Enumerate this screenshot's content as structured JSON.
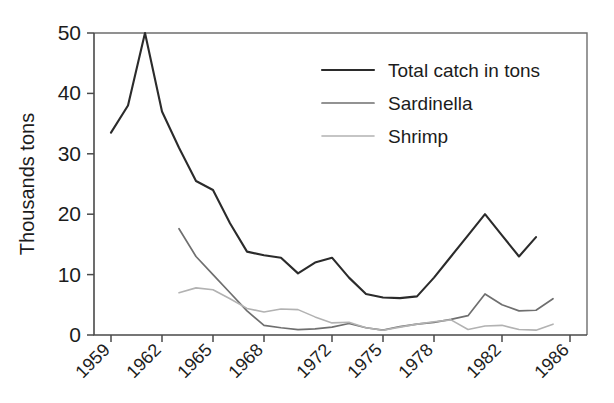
{
  "figure": {
    "background_color": "#ffffff",
    "axis_color": "#4a4a4a"
  },
  "axis": {
    "ylabel": "Thousands tons",
    "xlabel": "",
    "ytick_labels": [
      "0",
      "10",
      "20",
      "30",
      "40",
      "50"
    ],
    "xtick_labels": [
      "1959",
      "1962",
      "1965",
      "1968",
      "1972",
      "1975",
      "1978",
      "1982",
      "1986"
    ]
  },
  "legend": {
    "entries": [
      {
        "label": "Total catch in tons",
        "color": "#2b2b2b",
        "width": 2.1
      },
      {
        "label": "Sardinella",
        "color": "#6f6f6f",
        "width": 1.7
      },
      {
        "label": "Shrimp",
        "color": "#b2b2b2",
        "width": 1.6
      }
    ]
  },
  "chart_data": {
    "type": "line",
    "title": "",
    "xlabel": "",
    "ylabel": "Thousands tons",
    "xlim": [
      1958,
      1987
    ],
    "ylim": [
      0,
      50
    ],
    "yticks": [
      0,
      10,
      20,
      30,
      40,
      50
    ],
    "xticks": [
      1959,
      1962,
      1965,
      1968,
      1972,
      1975,
      1978,
      1982,
      1986
    ],
    "grid": false,
    "legend_position": "upper right",
    "x": [
      1959,
      1960,
      1961,
      1962,
      1963,
      1964,
      1965,
      1966,
      1967,
      1968,
      1969,
      1970,
      1971,
      1972,
      1973,
      1974,
      1975,
      1976,
      1977,
      1978,
      1979,
      1980,
      1981,
      1982,
      1983,
      1984,
      1985
    ],
    "series": [
      {
        "name": "Total catch in tons",
        "color": "#2b2b2b",
        "x": [
          1959,
          1960,
          1961,
          1962,
          1963,
          1964,
          1965,
          1966,
          1967,
          1968,
          1969,
          1970,
          1971,
          1972,
          1973,
          1974,
          1975,
          1976,
          1977,
          1978,
          1979,
          1980,
          1981,
          1982,
          1983,
          1984
        ],
        "values": [
          33.5,
          38.0,
          50.0,
          37.0,
          31.0,
          25.5,
          24.0,
          18.5,
          13.8,
          13.2,
          12.8,
          10.2,
          12.0,
          12.8,
          9.5,
          6.8,
          6.2,
          6.1,
          6.4,
          9.5,
          13.0,
          16.5,
          20.0,
          16.5,
          13.0,
          16.2
        ]
      },
      {
        "name": "Sardinella",
        "color": "#6f6f6f",
        "x": [
          1963,
          1964,
          1965,
          1966,
          1967,
          1968,
          1969,
          1970,
          1971,
          1972,
          1973,
          1974,
          1975,
          1976,
          1977,
          1978,
          1979,
          1980,
          1981,
          1982,
          1983,
          1984,
          1985
        ],
        "values": [
          17.6,
          13.0,
          10.0,
          7.0,
          4.0,
          1.6,
          1.2,
          0.9,
          1.0,
          1.3,
          1.9,
          1.2,
          0.8,
          1.4,
          1.8,
          2.1,
          2.6,
          3.2,
          6.8,
          5.0,
          4.0,
          4.1,
          6.0
        ]
      },
      {
        "name": "Shrimp",
        "color": "#b2b2b2",
        "x": [
          1963,
          1964,
          1965,
          1966,
          1967,
          1968,
          1969,
          1970,
          1971,
          1972,
          1973,
          1974,
          1975,
          1976,
          1977,
          1978,
          1979,
          1980,
          1981,
          1982,
          1983,
          1984,
          1985
        ],
        "values": [
          7.0,
          7.8,
          7.5,
          6.0,
          4.4,
          3.8,
          4.3,
          4.2,
          3.0,
          2.0,
          2.1,
          1.2,
          0.8,
          1.3,
          1.8,
          2.2,
          2.5,
          0.9,
          1.5,
          1.6,
          0.9,
          0.8,
          1.8
        ]
      }
    ]
  }
}
